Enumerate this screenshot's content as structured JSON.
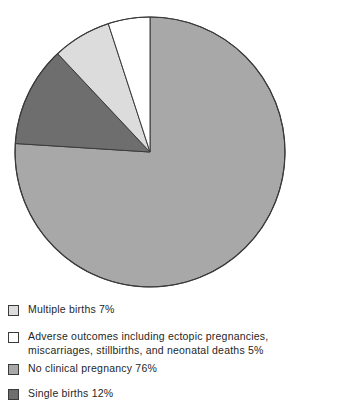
{
  "chart_data": {
    "type": "pie",
    "title": "",
    "subtitle": "",
    "xlabel": "",
    "ylabel": "",
    "legend_position": "bottom",
    "grid": false,
    "units": "percent",
    "start_angle_deg": 0,
    "direction": "clockwise",
    "categories": [
      "No clinical pregnancy",
      "Single births",
      "Multiple births",
      "Adverse outcomes including ectopic pregnancies, miscarriages, stillbirths, and neonatal deaths"
    ],
    "values": [
      76,
      12,
      7,
      5
    ],
    "slices": [
      {
        "label": "No clinical pregnancy",
        "value": 76,
        "value_text": "76%",
        "color": "#a8a8a8",
        "start_deg": 0,
        "sweep_deg": 273.6
      },
      {
        "label": "Single births",
        "value": 12,
        "value_text": "12%",
        "color": "#6e6e6e",
        "start_deg": 273.6,
        "sweep_deg": 43.2
      },
      {
        "label": "Multiple births",
        "value": 7,
        "value_text": "7%",
        "color": "#dcdcdc",
        "start_deg": 316.8,
        "sweep_deg": 25.2
      },
      {
        "label": "Adverse outcomes including ectopic pregnancies, miscarriages, stillbirths, and neonatal deaths",
        "value": 5,
        "value_text": "5%",
        "color": "#ffffff",
        "start_deg": 342,
        "sweep_deg": 18
      }
    ]
  },
  "pie": {
    "center_x": 150,
    "center_y": 152,
    "radius": 135,
    "outline_color": "#3a3a3a",
    "outline_width": 1.2
  },
  "legend": {
    "items": [
      {
        "label": "Multiple births 7%",
        "color": "#dcdcdc",
        "swatch_name": "legend-swatch-multiple-births"
      },
      {
        "label": "Adverse outcomes including ectopic pregnancies, miscarriages, stillbirths, and neonatal deaths 5%",
        "color": "#ffffff",
        "swatch_name": "legend-swatch-adverse-outcomes"
      },
      {
        "label": "No clinical pregnancy 76%",
        "color": "#a8a8a8",
        "swatch_name": "legend-swatch-no-clinical-pregnancy"
      },
      {
        "label": "Single births 12%",
        "color": "#6e6e6e",
        "swatch_name": "legend-swatch-single-births"
      }
    ]
  }
}
